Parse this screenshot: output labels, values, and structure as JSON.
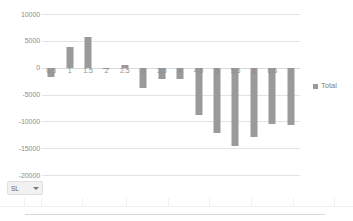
{
  "chart_data": {
    "type": "bar",
    "title": "",
    "xlabel": "",
    "ylabel": "",
    "ylim": [
      -20000,
      10000
    ],
    "yticks": [
      10000,
      5000,
      0,
      -5000,
      -10000,
      -15000,
      -20000
    ],
    "ytick_labels": [
      "10000",
      "5000",
      "0",
      "-5000",
      "-10000",
      "-15000",
      "-20000"
    ],
    "grid": true,
    "legend_position": "right",
    "categories": [
      "0.5",
      "1",
      "1.5",
      "2",
      "2.5",
      "3",
      "3.5",
      "4",
      "4.5",
      "5",
      "5.5",
      "6",
      "6.5",
      "7"
    ],
    "series": [
      {
        "name": "Total",
        "color": "#9a9a9a",
        "values": [
          -1800,
          3900,
          5800,
          -100,
          500,
          -3800,
          -2200,
          -2200,
          -8800,
          -12200,
          -14600,
          -13000,
          -10500,
          -10700
        ]
      }
    ]
  },
  "legend": {
    "entries": [
      {
        "label": "Total",
        "color": "#9a9a9a"
      }
    ]
  },
  "slicer": {
    "label": "SL",
    "caret": "chevron-down-icon"
  }
}
